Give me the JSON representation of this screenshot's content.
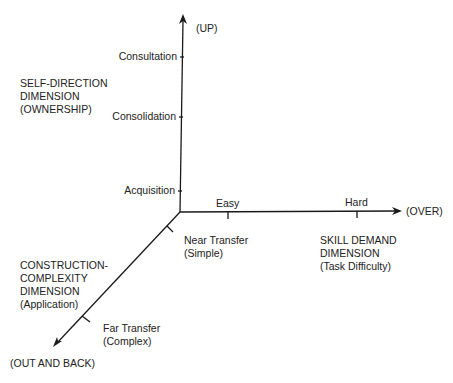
{
  "diagram": {
    "vertical_axis": {
      "direction_label": "(UP)",
      "dimension_lines": [
        "SELF-DIRECTION",
        "DIMENSION",
        "(OWNERSHIP)"
      ],
      "ticks": [
        "Consultation",
        "Consolidation",
        "Acquisition"
      ]
    },
    "horizontal_axis": {
      "direction_label": "(OVER)",
      "dimension_lines": [
        "SKILL DEMAND",
        "DIMENSION",
        "(Task Difficulty)"
      ],
      "ticks": [
        "Easy",
        "Hard"
      ]
    },
    "diagonal_axis": {
      "direction_label": "(OUT AND BACK)",
      "dimension_lines": [
        "CONSTRUCTION-",
        "COMPLEXITY",
        "DIMENSION",
        "(Application)"
      ],
      "near_tick": [
        "Near Transfer",
        "(Simple)"
      ],
      "far_tick": [
        "Far Transfer",
        "(Complex)"
      ]
    },
    "line_color": "#1a1a1a"
  }
}
